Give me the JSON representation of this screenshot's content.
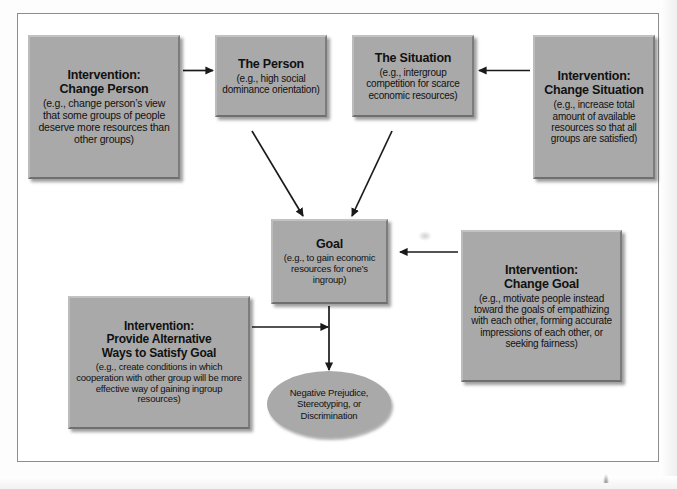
{
  "diagram": {
    "nodes": [
      {
        "id": "change-person",
        "title": "Intervention:\nChange Person",
        "title_line1": "Intervention:",
        "title_line2": "Change Person",
        "sub": "(e.g., change person’s view that some groups of people deserve more resources than other groups)"
      },
      {
        "id": "the-person",
        "title_line1": "The Person",
        "title_line2": "",
        "sub": "(e.g., high social dominance orientation)"
      },
      {
        "id": "the-situation",
        "title_line1": "The Situation",
        "title_line2": "",
        "sub": "(e.g., intergroup competition for scarce economic resources)"
      },
      {
        "id": "change-situation",
        "title_line1": "Intervention:",
        "title_line2": "Change Situation",
        "sub": "(e.g., increase total amount of available resources so that all groups are satisfied)"
      },
      {
        "id": "goal",
        "title_line1": "Goal",
        "title_line2": "",
        "sub": "(e.g., to gain economic resources for one’s ingroup)"
      },
      {
        "id": "change-goal",
        "title_line1": "Intervention:",
        "title_line2": "Change Goal",
        "sub": "(e.g., motivate people instead toward the goals of empathizing with each other, forming accurate impressions of each other, or seeking fairness)"
      },
      {
        "id": "provide-alternative",
        "title_line1": "Intervention:",
        "title_line2": "Provide Alternative",
        "title_line3": "Ways to Satisfy Goal",
        "sub": "(e.g., create conditions in which cooperation with other group will be more effective way of gaining ingroup resources)"
      },
      {
        "id": "outcome",
        "title_line1": "",
        "sub": "Negative Prejudice, Stereotyping, or Discrimination"
      }
    ],
    "edges": [
      {
        "from": "change-person",
        "to": "the-person",
        "kind": "arrow-right"
      },
      {
        "from": "change-situation",
        "to": "the-situation",
        "kind": "arrow-left"
      },
      {
        "from": "the-person",
        "to": "goal",
        "kind": "arrow-diagonal-down-right"
      },
      {
        "from": "the-situation",
        "to": "goal",
        "kind": "arrow-diagonal-down-left"
      },
      {
        "from": "change-goal",
        "to": "goal",
        "kind": "arrow-left"
      },
      {
        "from": "provide-alternative",
        "to": "goal-outcome-link",
        "kind": "arrow-right"
      },
      {
        "from": "goal",
        "to": "outcome",
        "kind": "arrow-down"
      }
    ],
    "colors": {
      "node_fill": "#a9a9a9",
      "node_highlight": "#c2c2c2",
      "node_shadow": "#6f6f6f",
      "frame_border": "#8d8d8d",
      "arrow": "#1a1a1a",
      "text": "#111111",
      "page_background": "#ffffff"
    }
  }
}
